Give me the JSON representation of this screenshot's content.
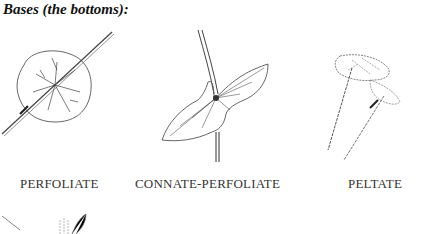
{
  "heading": "Bases (the bottoms):",
  "figures": [
    {
      "caption": "PERFOLIATE",
      "icon": "perfoliate-leaf-illustration"
    },
    {
      "caption": "CONNATE-PERFOLIATE",
      "icon": "connate-perfoliate-leaf-illustration"
    },
    {
      "caption": "PELTATE",
      "icon": "peltate-leaf-illustration"
    }
  ],
  "partial_figure": {
    "icon": "partial-leaf-illustration"
  }
}
